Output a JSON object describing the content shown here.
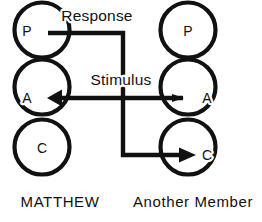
{
  "diagram": {
    "type": "transactional-analysis-crossed-transaction",
    "columns": [
      {
        "id": "left",
        "person_label": "MATTHEW",
        "label_x": 60,
        "label_y": 207,
        "center_x": 42,
        "ego_states": [
          {
            "letter": "P",
            "name": "parent",
            "cx": 42,
            "cy": 30,
            "r": 28,
            "letter_x": 27,
            "letter_y": 31
          },
          {
            "letter": "A",
            "name": "adult",
            "cx": 42,
            "cy": 87,
            "r": 28,
            "letter_x": 27,
            "letter_y": 98
          },
          {
            "letter": "C",
            "name": "child",
            "cx": 42,
            "cy": 147,
            "r": 28,
            "letter_x": 42,
            "letter_y": 148
          }
        ]
      },
      {
        "id": "right",
        "person_label": "Another Member",
        "label_x": 193,
        "label_y": 207,
        "center_x": 188,
        "ego_states": [
          {
            "letter": "P",
            "name": "parent",
            "cx": 188,
            "cy": 30,
            "r": 28,
            "letter_x": 188,
            "letter_y": 31
          },
          {
            "letter": "A",
            "name": "adult",
            "cx": 188,
            "cy": 87,
            "r": 28,
            "letter_x": 206,
            "letter_y": 98
          },
          {
            "letter": "C",
            "name": "child",
            "cx": 188,
            "cy": 147,
            "r": 28,
            "letter_x": 206,
            "letter_y": 155
          }
        ]
      }
    ],
    "transactions": [
      {
        "id": "response",
        "label": "Response",
        "label_x": 97,
        "label_y": 21,
        "from": "left-parent",
        "to": "right-child",
        "path": "M 48 33 L 123 33 L 123 155 L 186 155",
        "arrow": {
          "direction": "right",
          "tip_x": 196,
          "tip_y": 155
        }
      },
      {
        "id": "stimulus",
        "label": "Stimulus",
        "label_x": 121,
        "label_y": 85,
        "from": "right-adult",
        "to": "left-adult",
        "path": "M 183 98 L 56 98",
        "arrow": {
          "direction": "left",
          "tip_x": 48,
          "tip_y": 98
        },
        "tail_tick": {
          "x": 174,
          "y": 98
        }
      }
    ],
    "colors": {
      "ink": "#111111",
      "background": "#ffffff"
    }
  }
}
